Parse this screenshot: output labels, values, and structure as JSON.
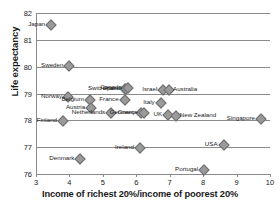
{
  "chart_data": {
    "type": "scatter",
    "title": "",
    "xlabel": "Income of richest 20%/income of poorest 20%",
    "ylabel": "Life expectancy",
    "xlim": [
      3,
      10
    ],
    "ylim": [
      76,
      82
    ],
    "xticks": [
      3,
      4,
      5,
      6,
      7,
      8,
      9,
      10
    ],
    "yticks": [
      76,
      77,
      78,
      79,
      80,
      81,
      82
    ],
    "grid": "horizontal",
    "legend": "none",
    "marker": "diamond",
    "marker_color": "#9a9a9a",
    "axis_color": "#8a8a8a",
    "points": [
      {
        "label": "Japan",
        "x": 3.42,
        "y": 81.6,
        "side": "left"
      },
      {
        "label": "Sweden",
        "x": 3.97,
        "y": 80.05,
        "side": "left"
      },
      {
        "label": "Norway",
        "x": 3.93,
        "y": 78.92,
        "side": "left"
      },
      {
        "label": "Belgium",
        "x": 4.58,
        "y": 78.8,
        "side": "left"
      },
      {
        "label": "Finland",
        "x": 3.78,
        "y": 78.0,
        "side": "left"
      },
      {
        "label": "Austria",
        "x": 4.62,
        "y": 78.5,
        "side": "left"
      },
      {
        "label": "Netherlands",
        "x": 5.22,
        "y": 78.3,
        "side": "left"
      },
      {
        "label": "Spain",
        "x": 5.62,
        "y": 79.22,
        "side": "left"
      },
      {
        "label": "Switzerland",
        "x": 5.66,
        "y": 79.2,
        "side": "left"
      },
      {
        "label": "France",
        "x": 5.62,
        "y": 78.8,
        "side": "left"
      },
      {
        "label": "Germany",
        "x": 6.12,
        "y": 78.3,
        "side": "left"
      },
      {
        "label": "Greece",
        "x": 6.2,
        "y": 78.3,
        "side": "left"
      },
      {
        "label": "Canada",
        "x": 5.72,
        "y": 79.25,
        "side": "left"
      },
      {
        "label": "Italy",
        "x": 6.7,
        "y": 78.7,
        "side": "left"
      },
      {
        "label": "Israel",
        "x": 6.78,
        "y": 79.18,
        "side": "left"
      },
      {
        "label": "Australia",
        "x": 6.95,
        "y": 79.18,
        "side": "right"
      },
      {
        "label": "UK",
        "x": 6.92,
        "y": 78.22,
        "side": "left"
      },
      {
        "label": "New Zealand",
        "x": 7.15,
        "y": 78.2,
        "side": "right"
      },
      {
        "label": "Singapore",
        "x": 9.7,
        "y": 78.08,
        "side": "left"
      },
      {
        "label": "Ireland",
        "x": 6.08,
        "y": 77.0,
        "side": "left"
      },
      {
        "label": "USA",
        "x": 8.58,
        "y": 77.1,
        "side": "left"
      },
      {
        "label": "Denmark",
        "x": 4.3,
        "y": 76.6,
        "side": "left"
      },
      {
        "label": "Portugal",
        "x": 8.0,
        "y": 76.2,
        "side": "left"
      }
    ]
  }
}
